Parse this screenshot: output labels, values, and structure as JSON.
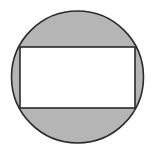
{
  "diagram": {
    "type": "geometry",
    "circle": {
      "cx": 77.5,
      "cy": 77,
      "r": 66,
      "fill": "#b5b5b5",
      "stroke": "#2a2a2a"
    },
    "rectangle": {
      "x": 20,
      "y": 47,
      "width": 115,
      "height": 61,
      "fill": "#ffffff",
      "stroke": "#2a2a2a"
    },
    "colors": {
      "shaded": "#b5b5b5",
      "line": "#2a2a2a",
      "background": "#ffffff"
    }
  }
}
